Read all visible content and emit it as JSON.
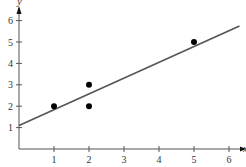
{
  "chart_data": {
    "type": "scatter",
    "title": "",
    "xlabel": "x",
    "ylabel": "y",
    "xlim": [
      0,
      6.4
    ],
    "ylim": [
      0,
      6.5
    ],
    "grid": false,
    "legend": null,
    "x_ticks": [
      1,
      2,
      3,
      4,
      5,
      6
    ],
    "y_ticks": [
      1,
      2,
      3,
      4,
      5,
      6
    ],
    "series": [
      {
        "name": "data points",
        "kind": "scatter",
        "points": [
          {
            "x": 1,
            "y": 2
          },
          {
            "x": 2,
            "y": 3
          },
          {
            "x": 2,
            "y": 2
          },
          {
            "x": 5,
            "y": 5
          }
        ]
      },
      {
        "name": "fitted line",
        "kind": "line",
        "points": [
          {
            "x": 0,
            "y": 1.1
          },
          {
            "x": 6.3,
            "y": 5.75
          }
        ]
      }
    ],
    "colors": {
      "axis": "#555555",
      "points": "#000000",
      "line": "#555555"
    }
  }
}
